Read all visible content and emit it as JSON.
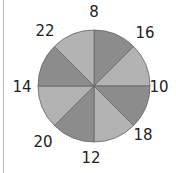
{
  "diagram": {
    "type": "circle-sectors",
    "colors": {
      "dark": "#8c8c8c",
      "light": "#b3b3b3",
      "stroke": "#666666"
    },
    "labels": [
      {
        "text": "8",
        "x": 94,
        "y": 12
      },
      {
        "text": "16",
        "x": 145,
        "y": 33
      },
      {
        "text": "10",
        "x": 159,
        "y": 87
      },
      {
        "text": "18",
        "x": 143,
        "y": 135
      },
      {
        "text": "12",
        "x": 91,
        "y": 158
      },
      {
        "text": "20",
        "x": 43,
        "y": 142
      },
      {
        "text": "14",
        "x": 22,
        "y": 87
      },
      {
        "text": "22",
        "x": 45,
        "y": 31
      }
    ]
  }
}
